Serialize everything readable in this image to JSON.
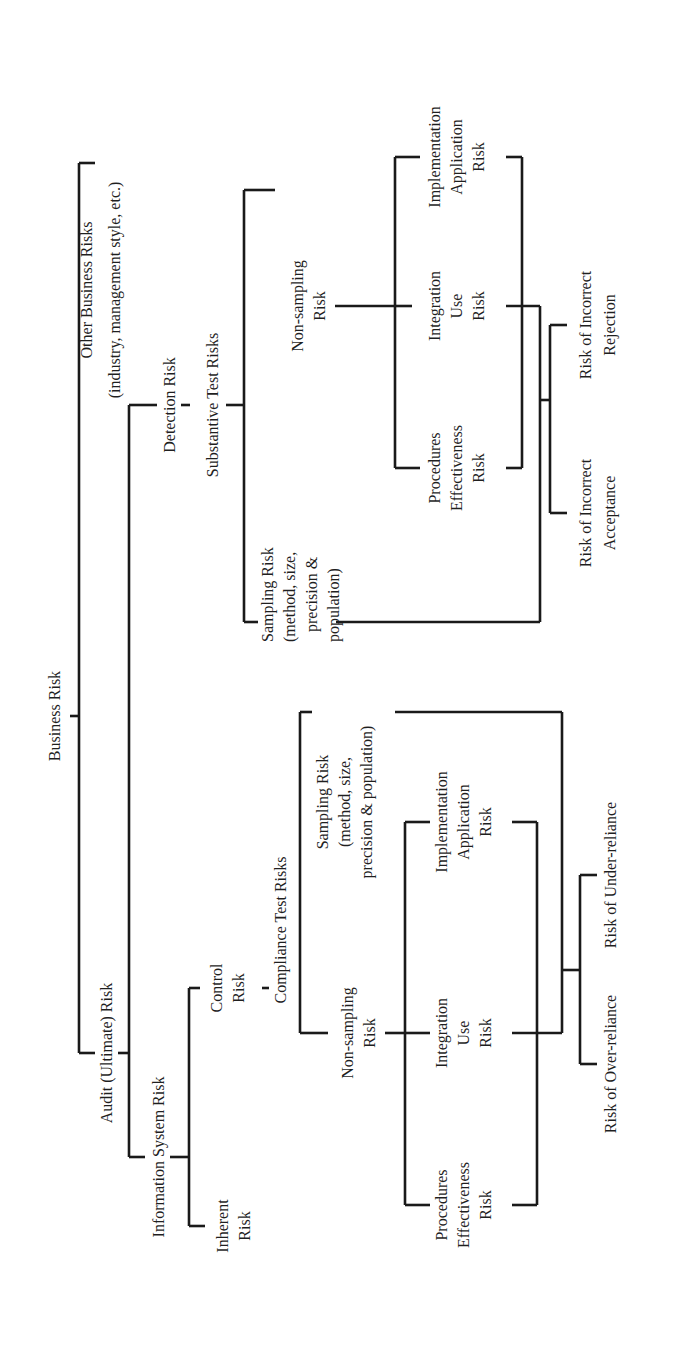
{
  "diagram": {
    "orientation": "rotated-90-ccw",
    "root": {
      "label": "Business Risk"
    },
    "other_business": {
      "line1": "Other Business Risks",
      "line2": "(industry, management style, etc.)"
    },
    "audit_risk": {
      "label": "Audit (Ultimate) Risk"
    },
    "info_system_risk": {
      "label": "Information System Risk"
    },
    "inherent_risk": {
      "line1": "Inherent",
      "line2": "Risk"
    },
    "control_risk": {
      "line1": "Control",
      "line2": "Risk"
    },
    "detection_risk": {
      "label": "Detection Risk"
    },
    "substantive": {
      "label": "Substantive Test Risks",
      "sampling": {
        "line1": "Sampling Risk",
        "line2": "(method, size,",
        "line3": "precision &",
        "line4": "population)"
      },
      "non_sampling": {
        "line1": "Non-sampling",
        "line2": "Risk"
      },
      "procedures": {
        "line1": "Procedures",
        "line2": "Effectiveness",
        "line3": "Risk"
      },
      "integration": {
        "line1": "Integration",
        "line2": "Use",
        "line3": "Risk"
      },
      "implementation": {
        "line1": "Implementation",
        "line2": "Application",
        "line3": "Risk"
      },
      "outcome_a": {
        "line1": "Risk of Incorrect",
        "line2": "Acceptance"
      },
      "outcome_b": {
        "line1": "Risk of Incorrect",
        "line2": "Rejection"
      }
    },
    "compliance": {
      "label": "Compliance Test Risks",
      "sampling": {
        "line1": "Sampling Risk",
        "line2": "(method, size,",
        "line3": "precision & population)"
      },
      "non_sampling": {
        "line1": "Non-sampling",
        "line2": "Risk"
      },
      "procedures": {
        "line1": "Procedures",
        "line2": "Effectiveness",
        "line3": "Risk"
      },
      "integration": {
        "line1": "Integration",
        "line2": "Use",
        "line3": "Risk"
      },
      "implementation": {
        "line1": "Implementation",
        "line2": "Application",
        "line3": "Risk"
      },
      "outcome_a": {
        "label": "Risk of Over-reliance"
      },
      "outcome_b": {
        "label": "Risk of Under-reliance"
      }
    },
    "line_color": "#1a1a1a",
    "background": "#ffffff"
  }
}
